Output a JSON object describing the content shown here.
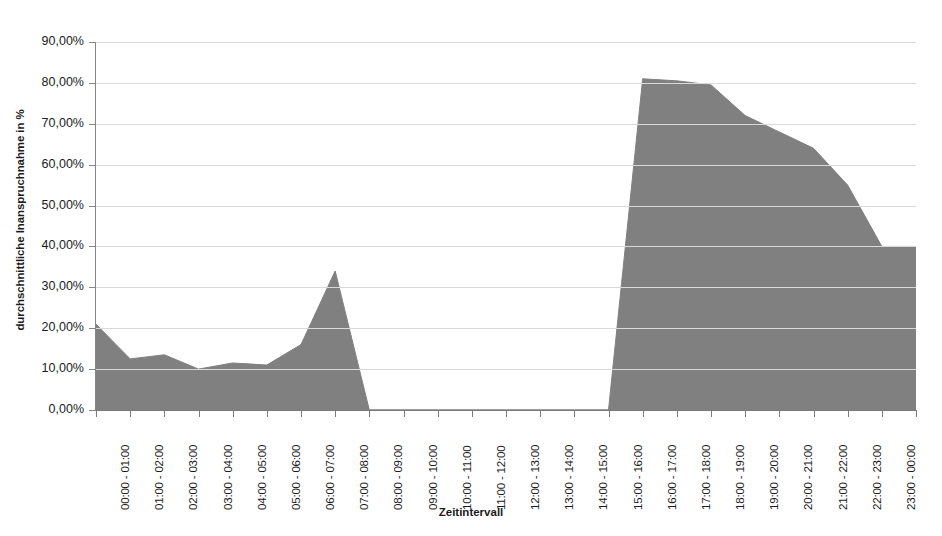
{
  "chart_data": {
    "type": "area",
    "title": "",
    "xlabel": "Zeitintervall",
    "ylabel": "durchschnittliche Inanspruchnahme in %",
    "ylim": [
      0,
      90
    ],
    "ytick_step": 10,
    "grid": true,
    "legend": "none",
    "series_color": "#808080",
    "categories": [
      "00:00 - 01:00",
      "01:00 - 02:00",
      "02:00 - 03:00",
      "03:00 - 04:00",
      "04:00 - 05:00",
      "05:00 - 06:00",
      "06:00 - 07:00",
      "07:00 - 08:00",
      "08:00 - 09:00",
      "09:00 - 10:00",
      "10:00 - 11:00",
      "11:00 - 12:00",
      "12:00 - 13:00",
      "13:00 - 14:00",
      "14:00 - 15:00",
      "15:00 - 16:00",
      "16:00 - 17:00",
      "17:00 - 18:00",
      "18:00 - 19:00",
      "19:00 - 20:00",
      "20:00 - 21:00",
      "21:00 - 22:00",
      "22:00 - 23:00",
      "23:00 - 00:00"
    ],
    "values": [
      21.0,
      12.5,
      13.5,
      10.0,
      11.5,
      11.0,
      16.0,
      34.0,
      0.0,
      0.0,
      0.0,
      0.0,
      0.0,
      0.0,
      0.0,
      0.0,
      81.0,
      80.5,
      79.5,
      72.0,
      68.0,
      64.0,
      55.0,
      40.0
    ],
    "ytick_labels": [
      "90,00%",
      "80,00%",
      "70,00%",
      "60,00%",
      "50,00%",
      "40,00%",
      "30,00%",
      "20,00%",
      "10,00%",
      "0,00%"
    ],
    "ytick_values": [
      90,
      80,
      70,
      60,
      50,
      40,
      30,
      20,
      10,
      0
    ]
  }
}
